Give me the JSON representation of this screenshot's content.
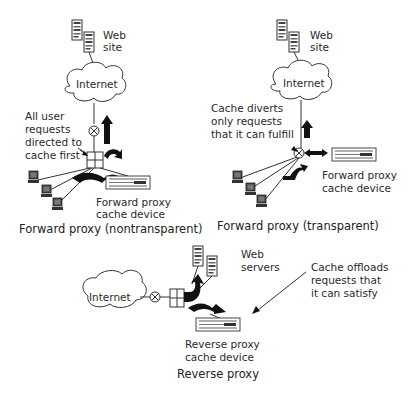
{
  "panels": {
    "nontransparent": {
      "site_label_1": "Web",
      "site_label_2": "site",
      "cloud_label": "Internet",
      "note_lines": [
        "All user",
        "requests",
        "directed to",
        "cache first"
      ],
      "device_label_1": "Forward proxy",
      "device_label_2": "cache device",
      "caption": "Forward proxy  (nontransparent)"
    },
    "transparent": {
      "site_label_1": "Web",
      "site_label_2": "site",
      "cloud_label": "Internet",
      "note_lines": [
        "Cache diverts",
        "only requests",
        "that it can fulfill"
      ],
      "device_label_1": "Forward proxy",
      "device_label_2": "cache device",
      "caption": "Forward proxy  (transparent)"
    },
    "reverse": {
      "cloud_label": "Internet",
      "servers_label_1": "Web",
      "servers_label_2": "servers",
      "note_lines": [
        "Cache offloads",
        "requests that",
        "it can satisfy"
      ],
      "device_label_1": "Reverse proxy",
      "device_label_2": "cache device",
      "caption": "Reverse proxy"
    }
  },
  "icons": [
    "server-icon",
    "cloud-icon",
    "router-icon",
    "switch-icon",
    "computer-icon",
    "cache-device-icon",
    "arrow-icon"
  ]
}
